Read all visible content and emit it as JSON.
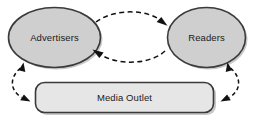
{
  "diagram": {
    "type": "flow-diagram",
    "background_color": "#ffffff",
    "nodes": [
      {
        "id": "advertisers",
        "label": "Advertisers",
        "shape": "ellipse",
        "fill_color": "#cfcfcf",
        "border_color": "#3a3a3a"
      },
      {
        "id": "readers",
        "label": "Readers",
        "shape": "ellipse",
        "fill_color": "#cfcfcf",
        "border_color": "#3a3a3a"
      },
      {
        "id": "media-outlet",
        "label": "Media Outlet",
        "shape": "rounded-rectangle",
        "fill_color": "#e6e6e6",
        "border_color": "#3a3a3a"
      }
    ],
    "connectors": [
      {
        "id": "advertisers-to-readers",
        "from": "advertisers",
        "to": "readers",
        "style": "dashed",
        "curve": "arc-upper",
        "arrowheads": "end",
        "color": "#111111"
      },
      {
        "id": "readers-to-advertisers",
        "from": "readers",
        "to": "advertisers",
        "style": "dashed",
        "curve": "arc-lower",
        "arrowheads": "end",
        "color": "#111111"
      },
      {
        "id": "advertisers-media-outlet",
        "from": "advertisers",
        "to": "media-outlet",
        "style": "dashed",
        "curve": "arc-left",
        "arrowheads": "both",
        "color": "#111111"
      },
      {
        "id": "readers-media-outlet",
        "from": "readers",
        "to": "media-outlet",
        "style": "dashed",
        "curve": "arc-right",
        "arrowheads": "both",
        "color": "#111111"
      }
    ]
  }
}
